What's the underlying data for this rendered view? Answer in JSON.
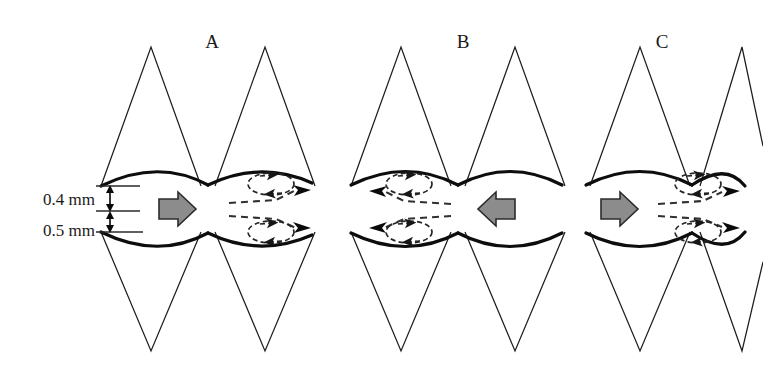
{
  "figure": {
    "type": "schematic-diagram",
    "background_color": "#ffffff",
    "line_color": "#1d1d1d",
    "wall_color": "#0d0d0d",
    "arrow_fill_color": "#8c8c8c",
    "arrow_stroke_color": "#2b2b2b"
  },
  "dimensions": {
    "throat_label": "0.4 mm",
    "chamber_label": "0.5 mm",
    "throat_value": 0.4,
    "chamber_value": 0.5,
    "unit": "mm"
  },
  "panels": [
    {
      "id": "A",
      "label": "A",
      "label_x": 212,
      "center_x": 215,
      "flow_direction": "right",
      "arrow_direction": "right",
      "vortex_side": "right",
      "vortex_count": 2
    },
    {
      "id": "B",
      "label": "B",
      "label_x": 463,
      "center_x": 465,
      "flow_direction": "left",
      "arrow_direction": "left",
      "vortex_side": "left",
      "vortex_count": 2
    },
    {
      "id": "C",
      "label": "C",
      "label_x": 662,
      "center_x": 640,
      "flow_direction": "right",
      "arrow_direction": "right",
      "vortex_side": "right",
      "vortex_count": 2
    }
  ],
  "geometry": {
    "axis_y": 209,
    "chamber_half_height": 24,
    "throat_half_height": 2,
    "triangle_apex_top_y": 45,
    "triangle_apex_bottom_y": 352,
    "wall_top_y": 185,
    "wall_bottom_y": 233
  }
}
